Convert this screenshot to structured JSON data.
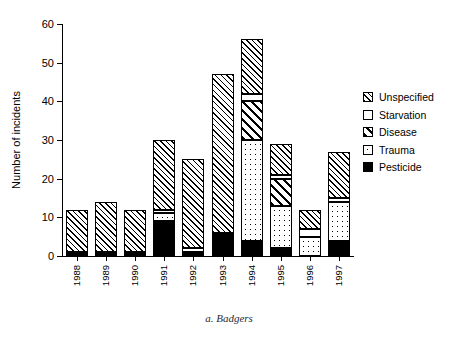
{
  "chart_data": {
    "type": "bar",
    "stacked": true,
    "title": "",
    "caption": "a. Badgers",
    "xlabel": "",
    "ylabel": "Number of incidents",
    "ylim": [
      0,
      60
    ],
    "yticks": [
      0,
      10,
      20,
      30,
      40,
      50,
      60
    ],
    "grid": false,
    "legend_position": "right",
    "categories": [
      "1988",
      "1989",
      "1990",
      "1991",
      "1992",
      "1993",
      "1994",
      "1995",
      "1996",
      "1997"
    ],
    "series": [
      {
        "name": "Pesticide",
        "pattern": "solid-black",
        "values": [
          1,
          1,
          1,
          9,
          1,
          6,
          4,
          2,
          0,
          4
        ]
      },
      {
        "name": "Trauma",
        "pattern": "dotted",
        "values": [
          0,
          0,
          0,
          2,
          0,
          0,
          26,
          11,
          5,
          10
        ]
      },
      {
        "name": "Disease",
        "pattern": "bold-diagonal",
        "values": [
          0,
          0,
          0,
          0,
          0,
          0,
          10,
          7,
          0,
          0
        ]
      },
      {
        "name": "Starvation",
        "pattern": "white",
        "values": [
          0,
          0,
          0,
          1,
          1,
          0,
          2,
          1,
          2,
          1
        ]
      },
      {
        "name": "Unspecified",
        "pattern": "fine-diagonal-hatch",
        "values": [
          11,
          13,
          11,
          18,
          23,
          41,
          14,
          8,
          5,
          12
        ]
      }
    ],
    "totals": [
      12,
      14,
      12,
      30,
      25,
      47,
      56,
      29,
      12,
      27
    ]
  },
  "legend": {
    "items": [
      {
        "label": "Unspecified",
        "pattern": "fine-diagonal-hatch"
      },
      {
        "label": "Starvation",
        "pattern": "white"
      },
      {
        "label": "Disease",
        "pattern": "bold-diagonal"
      },
      {
        "label": "Trauma",
        "pattern": "dotted"
      },
      {
        "label": "Pesticide",
        "pattern": "solid-black"
      }
    ]
  },
  "colors": {
    "axis": "#000000",
    "background": "#ffffff",
    "ink": "#000000"
  }
}
